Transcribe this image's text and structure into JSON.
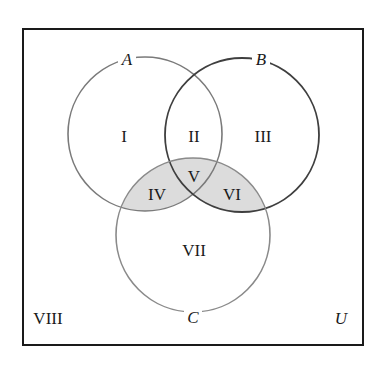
{
  "diagram": {
    "type": "venn-3-set",
    "universe": {
      "label": "U",
      "frame": {
        "x": 23,
        "y": 29,
        "width": 340,
        "height": 316
      },
      "stroke": "#1a1a1a"
    },
    "sets": [
      {
        "id": "A",
        "label": "A",
        "cx": 145,
        "cy": 134,
        "r": 77,
        "stroke": "#7a7a7a",
        "label_x": 127,
        "label_y": 65
      },
      {
        "id": "B",
        "label": "B",
        "cx": 242,
        "cy": 135,
        "r": 77,
        "stroke": "#3f3f3f",
        "label_x": 261,
        "label_y": 65
      },
      {
        "id": "C",
        "label": "C",
        "cx": 193,
        "cy": 235,
        "r": 77,
        "stroke": "#8a8a8a",
        "label_x": 193,
        "label_y": 323
      }
    ],
    "shading": {
      "description": "Regions IV, V and VI shaded: C ∩ (A ∪ B)",
      "fill": "#dcdcdc",
      "shaded_regions": [
        "IV",
        "V",
        "VI"
      ]
    },
    "regions": [
      {
        "id": "I",
        "label": "I",
        "x": 124,
        "y": 142,
        "sets": "A only"
      },
      {
        "id": "II",
        "label": "II",
        "x": 194,
        "y": 142,
        "sets": "A ∩ B only"
      },
      {
        "id": "III",
        "label": "III",
        "x": 263,
        "y": 142,
        "sets": "B only"
      },
      {
        "id": "IV",
        "label": "IV",
        "x": 157,
        "y": 200,
        "sets": "A ∩ C only"
      },
      {
        "id": "V",
        "label": "V",
        "x": 194,
        "y": 182,
        "sets": "A ∩ B ∩ C"
      },
      {
        "id": "VI",
        "label": "VI",
        "x": 232,
        "y": 200,
        "sets": "B ∩ C only"
      },
      {
        "id": "VII",
        "label": "VII",
        "x": 194,
        "y": 256,
        "sets": "C only"
      },
      {
        "id": "VIII",
        "label": "VIII",
        "x": 48,
        "y": 324,
        "sets": "outside A, B, C"
      }
    ],
    "universe_label": {
      "text": "U",
      "x": 341,
      "y": 324
    }
  }
}
